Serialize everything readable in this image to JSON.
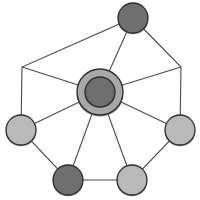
{
  "diagram": {
    "type": "node-link-graph",
    "canvas": {
      "width": 200,
      "height": 200,
      "background": "#ffffff"
    },
    "style": {
      "edge_color": "#4a4a4a",
      "edge_width": 1.1,
      "node_outline_color": "#2c2c2c",
      "node_shadow_color": "#6b6b6b",
      "dark_node_fill": "#6e6e6e",
      "light_node_fill": "#b9b9b9",
      "hub_ring_fill": "#a8a8a8",
      "hub_core_fill": "#6e6e6e"
    },
    "hub": {
      "label": "center-hub",
      "cx": 100,
      "cy": 92,
      "outer_radius": 23,
      "inner_radius": 15,
      "outer_fill": "#a8a8a8",
      "inner_fill": "#6e6e6e"
    },
    "nodes": [
      {
        "id": "node-top",
        "label": "top",
        "cx": 133,
        "cy": 18,
        "r": 15,
        "fill": "#6e6e6e",
        "tone": "dark"
      },
      {
        "id": "node-right",
        "label": "right",
        "cx": 180,
        "cy": 130,
        "r": 15,
        "fill": "#b9b9b9",
        "tone": "light"
      },
      {
        "id": "node-bottom-right",
        "label": "bottom-right",
        "cx": 132,
        "cy": 180,
        "r": 15,
        "fill": "#b9b9b9",
        "tone": "light"
      },
      {
        "id": "node-bottom-left",
        "label": "bottom-left",
        "cx": 68,
        "cy": 180,
        "r": 15,
        "fill": "#6e6e6e",
        "tone": "dark"
      },
      {
        "id": "node-left",
        "label": "left",
        "cx": 21,
        "cy": 130,
        "r": 15,
        "fill": "#b9b9b9",
        "tone": "light"
      },
      {
        "id": "node-upper-left-vertex",
        "label": "upper-left-corner",
        "cx": 22,
        "cy": 67,
        "r": 0,
        "fill": "none",
        "tone": "none"
      },
      {
        "id": "node-upper-right-vertex",
        "label": "upper-right-corner",
        "cx": 181,
        "cy": 67,
        "r": 0,
        "fill": "none",
        "tone": "none"
      }
    ],
    "ring_path": "M 133,18 L 181,67 L 180,130 L 132,180 L 68,180 L 21,130 L 22,67 Z",
    "spokes": [
      {
        "id": "spoke-top",
        "x1": 100,
        "y1": 92,
        "x2": 133,
        "y2": 18
      },
      {
        "id": "spoke-upper-right",
        "x1": 100,
        "y1": 92,
        "x2": 181,
        "y2": 67
      },
      {
        "id": "spoke-right",
        "x1": 100,
        "y1": 92,
        "x2": 180,
        "y2": 130
      },
      {
        "id": "spoke-bottom-right",
        "x1": 100,
        "y1": 92,
        "x2": 132,
        "y2": 180
      },
      {
        "id": "spoke-bottom-left",
        "x1": 100,
        "y1": 92,
        "x2": 68,
        "y2": 180
      },
      {
        "id": "spoke-left",
        "x1": 100,
        "y1": 92,
        "x2": 21,
        "y2": 130
      },
      {
        "id": "spoke-upper-left",
        "x1": 100,
        "y1": 92,
        "x2": 22,
        "y2": 67
      }
    ]
  }
}
